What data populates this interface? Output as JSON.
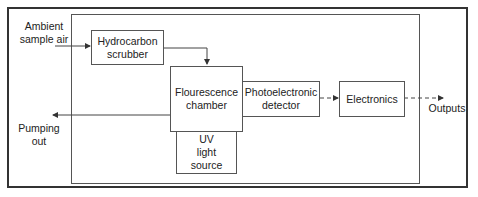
{
  "diagram": {
    "inputs": {
      "ambient_air": "Ambient\nsample air"
    },
    "blocks": {
      "scrubber": "Hydrocarbon\nscrubber",
      "chamber": "Flourescence\nchamber",
      "uv_source": "UV\nlight\nsource",
      "detector": "Photoelectronic\ndetector",
      "electronics": "Electronics"
    },
    "outputs": {
      "pumping": "Pumping\nout",
      "outputs": "Outputs"
    },
    "colors": {
      "line": "#444444",
      "frame": "#333333",
      "background": "#ffffff"
    }
  }
}
